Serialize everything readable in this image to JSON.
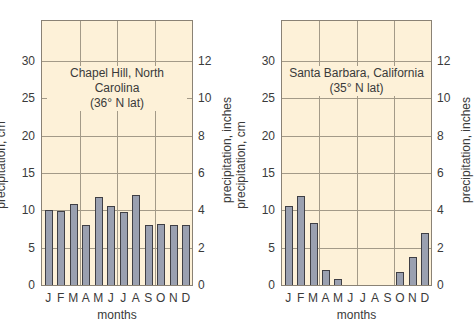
{
  "chart_data": [
    {
      "type": "bar",
      "title": "Chapel Hill, North Carolina",
      "subtitle": "(36° N lat)",
      "xlabel": "months",
      "ylabel": "precipitation, cm",
      "ylabel_right": "precipitation, inches",
      "categories": [
        "J",
        "F",
        "M",
        "A",
        "M",
        "J",
        "J",
        "A",
        "S",
        "O",
        "N",
        "D"
      ],
      "values": [
        10.0,
        9.9,
        10.9,
        8.0,
        11.8,
        10.6,
        9.8,
        12.0,
        8.0,
        8.2,
        8.1,
        8.1
      ],
      "ylim": [
        0,
        35
      ],
      "yticks": [
        0,
        5,
        10,
        15,
        20,
        25,
        30
      ],
      "yticks_right": [
        0,
        2,
        4,
        6,
        8,
        10,
        12
      ],
      "grid": true
    },
    {
      "type": "bar",
      "title": "Santa Barbara, California",
      "subtitle": "(35° N lat)",
      "xlabel": "months",
      "ylabel": "precipitation, cm",
      "ylabel_right": "precipitation, inches",
      "categories": [
        "J",
        "F",
        "M",
        "A",
        "M",
        "J",
        "J",
        "A",
        "S",
        "O",
        "N",
        "D"
      ],
      "values": [
        10.6,
        11.9,
        8.3,
        2.0,
        0.8,
        0,
        0,
        0,
        0,
        1.7,
        3.8,
        7.0
      ],
      "ylim": [
        0,
        35
      ],
      "yticks": [
        0,
        5,
        10,
        15,
        20,
        25,
        30
      ],
      "yticks_right": [
        0,
        2,
        4,
        6,
        8,
        10,
        12
      ],
      "grid": true
    }
  ],
  "style": {
    "plot_bg": "#fdf1d8",
    "bar_fill": "#9aa0b0",
    "bar_edge": "#3f3f45",
    "grid": "#a39a88"
  }
}
